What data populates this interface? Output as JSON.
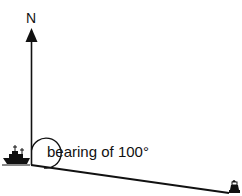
{
  "diagram": {
    "north_label": "N",
    "bearing_label": "bearing of 100°",
    "bearing_degrees": 100,
    "icons": {
      "origin": "ship-icon",
      "destination": "lighthouse-icon",
      "north": "north-arrow-icon"
    },
    "colors": {
      "line": "#111111",
      "background": "#ffffff"
    }
  }
}
